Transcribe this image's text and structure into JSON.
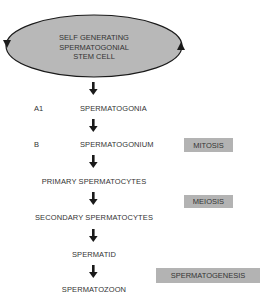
{
  "diagram": {
    "stem_cell": {
      "lines": [
        "SELF GENERATING",
        "SPERMATOGONIAL",
        "STEM CELL"
      ],
      "fill": "#b8b8b8",
      "cycle_arrows": [
        "left-down",
        "right-up"
      ]
    },
    "stages": [
      {
        "prefix": "A1",
        "label": "SPERMATOGONIA"
      },
      {
        "prefix": "B",
        "label": "SPERMATOGONIUM"
      },
      {
        "prefix": "",
        "label": "PRIMARY SPERMATOCYTES"
      },
      {
        "prefix": "",
        "label": "SECONDARY SPERMATOCYTES"
      },
      {
        "prefix": "",
        "label": "SPERMATID"
      },
      {
        "prefix": "",
        "label": "SPERMATOZOON"
      }
    ],
    "process_labels": [
      {
        "label": "MITOSIS"
      },
      {
        "label": "MEIOSIS"
      },
      {
        "label": "SPERMATOGENESIS"
      }
    ],
    "arrow_count": 6,
    "colors": {
      "badge": "#b3b3b3",
      "text": "#333333",
      "arrow": "#1a1a1a"
    }
  }
}
